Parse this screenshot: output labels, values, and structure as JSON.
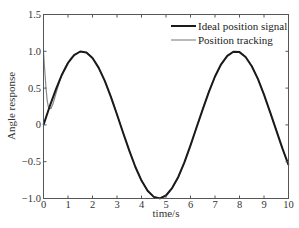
{
  "chart_data": {
    "type": "line",
    "title": "",
    "xlabel": "time/s",
    "ylabel": "Angle response",
    "xlim": [
      0,
      10
    ],
    "ylim": [
      -1.0,
      1.5
    ],
    "xticks": [
      "0",
      "1",
      "2",
      "3",
      "4",
      "5",
      "6",
      "7",
      "8",
      "9",
      "10"
    ],
    "yticks": [
      "1.5",
      "1.0",
      "0.5",
      "0",
      "-0.5",
      "-1.0"
    ],
    "grid": false,
    "legend_position": "upper right",
    "series": [
      {
        "name": "Ideal position signal",
        "color": "#1a1a1a",
        "width": 2,
        "x": [
          0,
          0.25,
          0.5,
          0.75,
          1.0,
          1.25,
          1.5,
          1.75,
          2.0,
          2.25,
          2.5,
          2.75,
          3.0,
          3.25,
          3.5,
          3.75,
          4.0,
          4.25,
          4.5,
          4.75,
          5.0,
          5.25,
          5.5,
          5.75,
          6.0,
          6.25,
          6.5,
          6.75,
          7.0,
          7.25,
          7.5,
          7.75,
          8.0,
          8.25,
          8.5,
          8.75,
          9.0,
          9.25,
          9.5,
          9.75,
          10.0
        ],
        "y": [
          0,
          0.247,
          0.479,
          0.682,
          0.841,
          0.949,
          0.997,
          0.984,
          0.909,
          0.778,
          0.598,
          0.382,
          0.141,
          -0.108,
          -0.351,
          -0.572,
          -0.757,
          -0.895,
          -0.978,
          -0.999,
          -0.959,
          -0.859,
          -0.706,
          -0.508,
          -0.279,
          -0.033,
          0.215,
          0.45,
          0.657,
          0.823,
          0.938,
          0.994,
          0.989,
          0.923,
          0.798,
          0.625,
          0.412,
          0.174,
          -0.075,
          -0.319,
          -0.544
        ]
      },
      {
        "name": "Position tracking",
        "color": "#8a8a8a",
        "width": 1.2,
        "x": [
          0,
          0.05,
          0.1,
          0.15,
          0.2,
          0.3,
          0.4,
          0.5,
          0.6,
          0.7,
          0.8,
          0.9,
          1.0,
          1.1,
          1.2,
          1.25,
          1.5,
          1.75,
          2.0,
          2.25,
          2.5,
          2.75,
          3.0,
          3.25,
          3.5,
          3.75,
          4.0,
          4.25,
          4.5,
          4.75,
          5.0,
          5.25,
          5.5,
          5.75,
          6.0,
          6.25,
          6.5,
          6.75,
          7.0,
          7.25,
          7.5,
          7.75,
          8.0,
          8.25,
          8.5,
          8.75,
          9.0,
          9.25,
          9.5,
          9.75,
          10.0
        ],
        "y": [
          1.0,
          0.75,
          0.5,
          0.33,
          0.24,
          0.22,
          0.3,
          0.42,
          0.53,
          0.63,
          0.72,
          0.79,
          0.85,
          0.9,
          0.935,
          0.949,
          0.997,
          0.984,
          0.909,
          0.778,
          0.598,
          0.382,
          0.141,
          -0.108,
          -0.351,
          -0.572,
          -0.757,
          -0.895,
          -0.978,
          -0.999,
          -0.959,
          -0.859,
          -0.706,
          -0.508,
          -0.279,
          -0.033,
          0.215,
          0.45,
          0.657,
          0.823,
          0.938,
          0.994,
          0.989,
          0.923,
          0.798,
          0.625,
          0.412,
          0.174,
          -0.075,
          -0.319,
          -0.544
        ]
      }
    ]
  },
  "legend": {
    "items": [
      {
        "label": "Ideal position signal",
        "color": "#1a1a1a"
      },
      {
        "label": "Position tracking",
        "color": "#8a8a8a"
      }
    ]
  }
}
